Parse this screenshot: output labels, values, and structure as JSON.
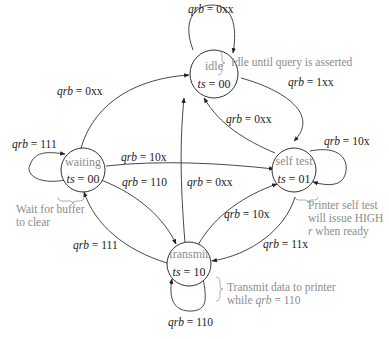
{
  "diagram": {
    "type": "state-machine",
    "states": [
      {
        "id": "idle",
        "name": "idle",
        "ts_var": "ts",
        "ts_value": "00"
      },
      {
        "id": "waiting",
        "name": "waiting",
        "ts_var": "ts",
        "ts_value": "00"
      },
      {
        "id": "self_test",
        "name": "self test",
        "ts_var": "ts",
        "ts_value": "01"
      },
      {
        "id": "transmit",
        "name": "transmit",
        "ts_var": "ts",
        "ts_value": "10"
      }
    ],
    "transitions": [
      {
        "from": "idle",
        "to": "idle",
        "var": "qrb",
        "value": "0xx"
      },
      {
        "from": "idle",
        "to": "self_test",
        "var": "qrb",
        "value": "1xx"
      },
      {
        "from": "self_test",
        "to": "idle",
        "var": "qrb",
        "value": "0xx"
      },
      {
        "from": "waiting",
        "to": "idle",
        "var": "qrb",
        "value": "0xx"
      },
      {
        "from": "waiting",
        "to": "waiting",
        "var": "qrb",
        "value": "111"
      },
      {
        "from": "waiting",
        "to": "self_test",
        "var": "qrb",
        "value": "10x"
      },
      {
        "from": "waiting",
        "to": "transmit",
        "var": "qrb",
        "value": "110"
      },
      {
        "from": "transmit",
        "to": "idle",
        "var": "qrb",
        "value": "0xx"
      },
      {
        "from": "self_test",
        "to": "self_test",
        "var": "qrb",
        "value": "10x"
      },
      {
        "from": "transmit",
        "to": "self_test",
        "var": "qrb",
        "value": "10x"
      },
      {
        "from": "self_test",
        "to": "transmit",
        "var": "qrb",
        "value": "11x"
      },
      {
        "from": "transmit",
        "to": "waiting",
        "var": "qrb",
        "value": "111"
      },
      {
        "from": "transmit",
        "to": "transmit",
        "var": "qrb",
        "value": "110"
      }
    ],
    "annotations": {
      "idle": "Idle until query is asserted",
      "waiting_line1": "Wait for buffer",
      "waiting_line2": "to clear",
      "self_test_line1": "Printer self test",
      "self_test_line2": "will issue HIGH",
      "self_test_line3_var": "r",
      "self_test_line3_rest": " when ready",
      "transmit_line1": "Transmit data to printer",
      "transmit_line2_pre": "while ",
      "transmit_line2_var": "qrb",
      "transmit_line2_post": " = 110"
    },
    "eq": " = "
  }
}
